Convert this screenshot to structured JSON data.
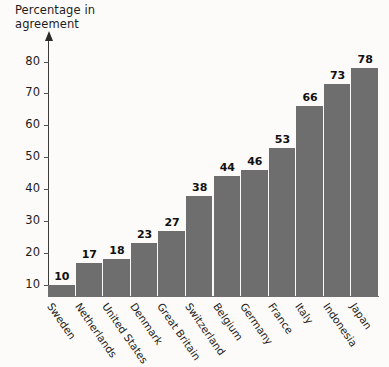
{
  "chart_data": {
    "type": "bar",
    "title": "",
    "xlabel": "",
    "ylabel": "Percentage in\nagreement",
    "ylim": [
      6.5,
      82
    ],
    "ytick_values": [
      10,
      20,
      30,
      40,
      50,
      60,
      70,
      80
    ],
    "ytick_labels": [
      "10",
      "20",
      "30",
      "40",
      "50",
      "60",
      "70",
      "80"
    ],
    "grid": false,
    "legend": false,
    "bar_color": "#6e6e6e",
    "background_color": "#fcfbf9",
    "axis_color": "#3a3a3a",
    "categories": [
      "Sweden",
      "Netherlands",
      "United States",
      "Denmark",
      "Great Britain",
      "Switzerland",
      "Belgium",
      "Germany",
      "France",
      "Italy",
      "Indonesia",
      "Japan"
    ],
    "values": [
      10,
      17,
      18,
      23,
      27,
      38,
      44,
      46,
      53,
      66,
      73,
      78
    ],
    "value_labels": [
      "10",
      "17",
      "18",
      "23",
      "27",
      "38",
      "44",
      "46",
      "53",
      "66",
      "73",
      "78"
    ]
  }
}
